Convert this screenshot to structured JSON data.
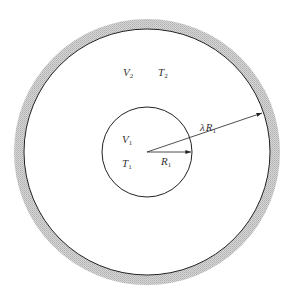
{
  "diagram": {
    "colors": {
      "background": "#ffffff",
      "line": "#222222",
      "shell": "#c8c8c8",
      "text": "#333333"
    },
    "geometry": {
      "center_x": 147,
      "center_y": 152,
      "outer_radius": 123,
      "shell_thickness": 10,
      "inner_radius": 45
    },
    "outer_region": {
      "volume_label": "V",
      "volume_sub": "2",
      "temperature_label": "T",
      "temperature_sub": "2"
    },
    "inner_region": {
      "volume_label": "V",
      "volume_sub": "1",
      "temperature_label": "T",
      "temperature_sub": "1"
    },
    "arrows": {
      "inner_radius_label": "R",
      "inner_radius_sub": "1",
      "outer_radius_prefix": "λ",
      "outer_radius_label": "R",
      "outer_radius_sub": "1"
    }
  }
}
